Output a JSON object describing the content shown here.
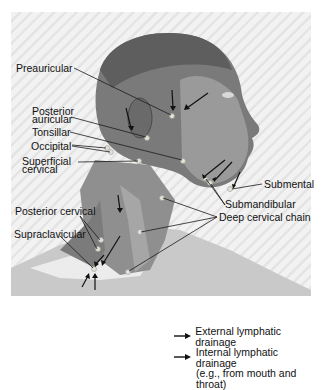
{
  "figure": {
    "labels": {
      "preauricular": "Preauricular",
      "posterior_auricular_1": "Posterior",
      "posterior_auricular_2": "auricular",
      "tonsillar": "Tonsillar",
      "occipital": "Occipital",
      "superficial_cervical_1": "Superficial",
      "superficial_cervical_2": "cervical",
      "submental": "Submental",
      "submandibular": "Submandibular",
      "deep_cervical_chain": "Deep cervical chain",
      "posterior_cervical": "Posterior cervical",
      "supraclavicular": "Supraclavicular"
    }
  },
  "legend": {
    "items": [
      {
        "icon": "arrow-right-icon",
        "label": "External lymphatic drainage"
      },
      {
        "icon": "arrow-right-icon",
        "label": "Internal lymphatic drainage",
        "sublabel": "(e.g., from mouth and throat)"
      }
    ]
  },
  "colors": {
    "text": "#111111",
    "leader_line": "#1a1a1a",
    "skin_dark": "#5a5a5a",
    "skin_mid": "#8c8c8c",
    "skin_light": "#bdbdbd"
  }
}
